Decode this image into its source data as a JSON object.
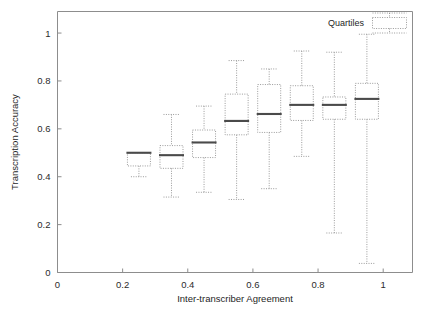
{
  "chart_data": {
    "type": "box",
    "title": "",
    "xlabel": "Inter-transcriber Agreement",
    "ylabel": "Transcription Accuracy",
    "xlim": [
      0,
      1.09
    ],
    "ylim": [
      0,
      1.09
    ],
    "xticks": [
      0,
      0.2,
      0.4,
      0.6,
      0.8,
      1
    ],
    "xtick_labels": [
      "0",
      "0.2",
      "0.4",
      "0.6",
      "0.8",
      "1"
    ],
    "yticks": [
      0,
      0.2,
      0.4,
      0.6,
      0.8,
      1
    ],
    "ytick_labels": [
      "0",
      "0.2",
      "0.4",
      "0.6",
      "0.8",
      "1"
    ],
    "grid": false,
    "legend": {
      "position": "top-right",
      "entries": [
        {
          "label": "Quartiles",
          "marker": "dotted-box"
        }
      ]
    },
    "boxes": [
      {
        "x": 0.25,
        "whisker_low": 0.4,
        "q1": 0.445,
        "median": 0.5,
        "q3": 0.5,
        "whisker_high": 0.5
      },
      {
        "x": 0.35,
        "whisker_low": 0.315,
        "q1": 0.435,
        "median": 0.49,
        "q3": 0.53,
        "whisker_high": 0.66
      },
      {
        "x": 0.45,
        "whisker_low": 0.335,
        "q1": 0.48,
        "median": 0.543,
        "q3": 0.595,
        "whisker_high": 0.695
      },
      {
        "x": 0.55,
        "whisker_low": 0.305,
        "q1": 0.575,
        "median": 0.633,
        "q3": 0.745,
        "whisker_high": 0.885
      },
      {
        "x": 0.65,
        "whisker_low": 0.35,
        "q1": 0.585,
        "median": 0.662,
        "q3": 0.785,
        "whisker_high": 0.85
      },
      {
        "x": 0.75,
        "whisker_low": 0.485,
        "q1": 0.635,
        "median": 0.7,
        "q3": 0.78,
        "whisker_high": 0.925
      },
      {
        "x": 0.85,
        "whisker_low": 0.165,
        "q1": 0.64,
        "median": 0.7,
        "q3": 0.733,
        "whisker_high": 0.92
      },
      {
        "x": 0.95,
        "whisker_low": 0.038,
        "q1": 0.64,
        "median": 0.725,
        "q3": 0.79,
        "whisker_high": 0.995
      }
    ]
  },
  "axes": {
    "x_title": "Inter-transcriber Agreement",
    "y_title": "Transcription Accuracy"
  },
  "legend": {
    "quartiles_label": "Quartiles"
  },
  "colors": {
    "frame": "#8d8d8d",
    "box": "#9a9a9a",
    "median": "#4a4a4a",
    "text": "#1e1e1e",
    "background": "#ffffff"
  }
}
